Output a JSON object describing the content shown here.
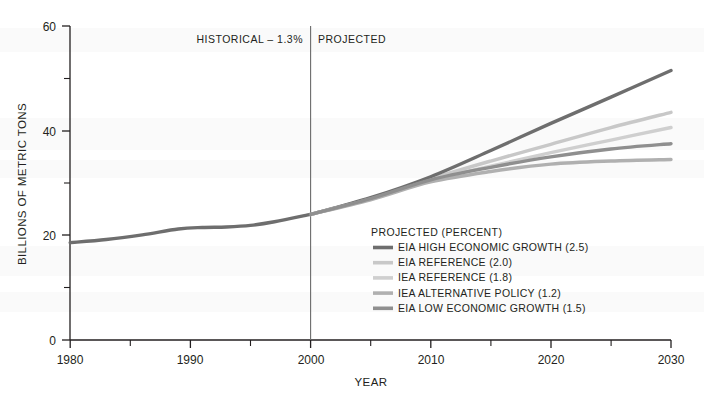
{
  "chart_data": {
    "type": "line",
    "title": "",
    "xlabel": "YEAR",
    "ylabel": "BILLIONS OF METRIC TONS",
    "xlim": [
      1980,
      2030
    ],
    "ylim": [
      0,
      60
    ],
    "x_ticks": [
      1980,
      1990,
      2000,
      2010,
      2020,
      2030
    ],
    "x_tick_labels": [
      "1980",
      "1990",
      "2000",
      "2010",
      "2020",
      "2030"
    ],
    "x_minor_ticks": [
      1985,
      1995,
      2005,
      2015,
      2025
    ],
    "y_ticks": [
      0,
      20,
      40,
      60
    ],
    "y_tick_labels": [
      "0",
      "20",
      "40",
      "60"
    ],
    "y_minor_ticks": [
      10,
      30,
      50
    ],
    "grid": false,
    "legend_position": "inside-center-right",
    "divider_year": 2000,
    "annotations": [
      {
        "name": "historical-label",
        "text": "HISTORICAL – 1.3%",
        "x": 1996.5,
        "y": 57.5,
        "align": "end"
      },
      {
        "name": "projected-label",
        "text": "PROJECTED",
        "x": 2001.5,
        "y": 57.5,
        "align": "start"
      }
    ],
    "series": [
      {
        "name": "HISTORICAL",
        "color": "#6e6e6e",
        "width": 3.4,
        "x": [
          1980,
          1983,
          1986,
          1989,
          1991,
          1993,
          1995,
          1997,
          2000
        ],
        "values": [
          18.6,
          19.2,
          20.1,
          21.2,
          21.5,
          21.6,
          21.9,
          22.6,
          24.0
        ]
      },
      {
        "name": "EIA HIGH ECONOMIC GROWTH (2.5)",
        "color": "#6e6e6e",
        "width": 3.4,
        "x": [
          2000,
          2005,
          2010,
          2015,
          2020,
          2025,
          2030
        ],
        "values": [
          24.0,
          27.2,
          31.2,
          36.2,
          41.4,
          46.4,
          51.5
        ]
      },
      {
        "name": "EIA REFERENCE (2.0)",
        "color": "#c8c8c8",
        "width": 3.4,
        "x": [
          2000,
          2005,
          2010,
          2015,
          2020,
          2025,
          2030
        ],
        "values": [
          24.0,
          27.0,
          30.8,
          34.2,
          37.4,
          40.6,
          43.5
        ]
      },
      {
        "name": "IEA REFERENCE (1.8)",
        "color": "#cfcfcf",
        "width": 3.4,
        "x": [
          2000,
          2005,
          2010,
          2015,
          2020,
          2025,
          2030
        ],
        "values": [
          24.0,
          26.9,
          30.5,
          33.2,
          35.8,
          38.2,
          40.6
        ]
      },
      {
        "name": "IEA ALTERNATIVE POLICY (1.2)",
        "color": "#b0b0b0",
        "width": 3.4,
        "x": [
          2000,
          2005,
          2010,
          2015,
          2020,
          2025,
          2030
        ],
        "values": [
          24.0,
          26.8,
          30.2,
          32.2,
          33.6,
          34.2,
          34.5
        ]
      },
      {
        "name": "EIA LOW ECONOMIC GROWTH (1.5)",
        "color": "#8f8f8f",
        "width": 3.4,
        "x": [
          2000,
          2005,
          2010,
          2015,
          2020,
          2025,
          2030
        ],
        "values": [
          24.0,
          27.0,
          30.6,
          33.0,
          35.0,
          36.5,
          37.5
        ]
      }
    ]
  },
  "axes": {
    "y_title": "BILLIONS OF METRIC TONS",
    "x_title": "YEAR",
    "y_tick_labels": [
      "60",
      "40",
      "20",
      "0"
    ],
    "x_tick_labels": [
      "1980",
      "1990",
      "2000",
      "2010",
      "2020",
      "2030"
    ]
  },
  "bands": {
    "historical": "HISTORICAL – 1.3%",
    "projected": "PROJECTED"
  },
  "legend": {
    "title": "PROJECTED (PERCENT)",
    "items": [
      {
        "label": "EIA HIGH ECONOMIC GROWTH (2.5)",
        "color": "#6e6e6e"
      },
      {
        "label": "EIA REFERENCE (2.0)",
        "color": "#c8c8c8"
      },
      {
        "label": "IEA REFERENCE (1.8)",
        "color": "#cfcfcf"
      },
      {
        "label": "IEA ALTERNATIVE POLICY (1.2)",
        "color": "#b0b0b0"
      },
      {
        "label": "EIA LOW ECONOMIC GROWTH (1.5)",
        "color": "#8f8f8f"
      }
    ]
  },
  "colors": {
    "axis": "#231f20",
    "text": "#231f20",
    "background": "#ffffff"
  }
}
